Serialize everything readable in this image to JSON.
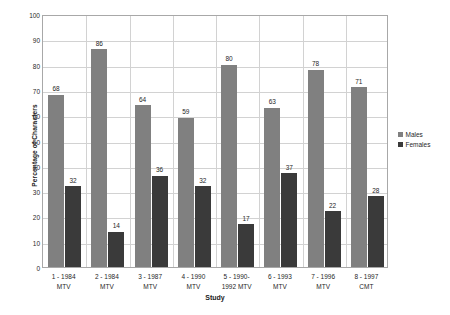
{
  "chart_data": {
    "type": "bar",
    "title": "",
    "xlabel": "Study",
    "ylabel": "Percentage of Characters",
    "ylim": [
      0,
      100
    ],
    "ytick_step": 10,
    "yticks": [
      100,
      90,
      80,
      70,
      60,
      50,
      40,
      30,
      20,
      10,
      0
    ],
    "grid": true,
    "legend_position": "right",
    "categories": [
      "1 - 1984 MTV",
      "2 - 1984 MTV",
      "3 - 1987 MTV",
      "4 - 1990 MTV",
      "5 - 1990-1992 MTV",
      "6 - 1993 MTV",
      "7 - 1996 MTV",
      "8 - 1997 CMT"
    ],
    "category_lines": [
      [
        "1 - 1984",
        "MTV"
      ],
      [
        "2 - 1984",
        "MTV"
      ],
      [
        "3 - 1987",
        "MTV"
      ],
      [
        "4 - 1990",
        "MTV"
      ],
      [
        "5 - 1990-",
        "1992 MTV"
      ],
      [
        "6 - 1993",
        "MTV"
      ],
      [
        "7 - 1996",
        "MTV"
      ],
      [
        "8 - 1997",
        "CMT"
      ]
    ],
    "series": [
      {
        "name": "Males",
        "color": "#808080",
        "values": [
          68,
          86,
          64,
          59,
          80,
          63,
          78,
          71
        ]
      },
      {
        "name": "Females",
        "color": "#3a3a3a",
        "values": [
          32,
          14,
          36,
          32,
          17,
          37,
          22,
          28
        ]
      }
    ]
  },
  "legend": {
    "items": [
      {
        "label": "Males",
        "color": "#808080"
      },
      {
        "label": "Females",
        "color": "#3a3a3a"
      }
    ]
  },
  "axes": {
    "x_title": "Study",
    "y_title": "Percentage of Characters"
  }
}
